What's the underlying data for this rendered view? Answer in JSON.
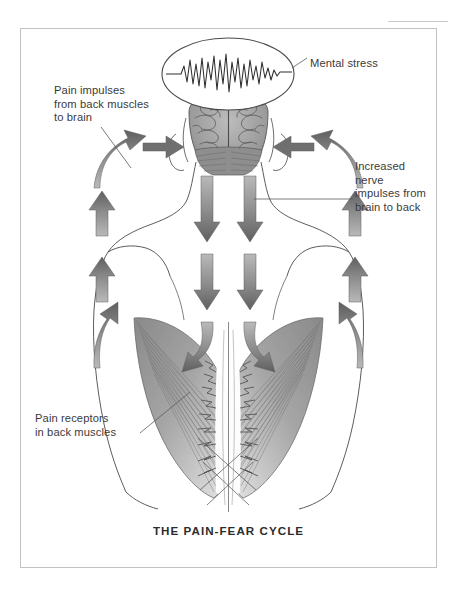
{
  "figure": {
    "caption": "THE PAIN-FEAR CYCLE",
    "border_color": "#c2c2c2",
    "background_color": "#ffffff",
    "text_color": "#3b3b3b",
    "arrow_color": "#6d6d6d",
    "muscle_color": "#8d8d8d"
  },
  "labels": {
    "mental_stress": "Mental stress",
    "pain_impulses": "Pain impulses\nfrom back muscles\nto brain",
    "increased_nerve": "Increased\nnerve\nimpulses from\nbrain to back",
    "pain_receptors": "Pain receptors\nin back muscles"
  },
  "diagram": {
    "type": "anatomical-illustration",
    "elements": [
      "oval-with-eeg-waveform",
      "brain-posterior-view",
      "head-and-neck-outline",
      "shoulders-and-torso-outline",
      "latissimus-dorsi-muscles",
      "spine-line",
      "pain-receptor-zigzag-marks",
      "ascending-arrows-left",
      "ascending-arrows-right",
      "curved-arrows-to-brain",
      "descending-arrows-center"
    ],
    "arrow_groups": [
      {
        "name": "pain-impulses-up-left",
        "direction": "up",
        "count": 2
      },
      {
        "name": "pain-impulses-up-right",
        "direction": "up",
        "count": 2
      },
      {
        "name": "curved-into-brain-left",
        "direction": "up-right",
        "count": 2
      },
      {
        "name": "curved-into-brain-right",
        "direction": "up-left",
        "count": 2
      },
      {
        "name": "nerve-impulses-down-center",
        "direction": "down",
        "count": 6
      }
    ]
  }
}
